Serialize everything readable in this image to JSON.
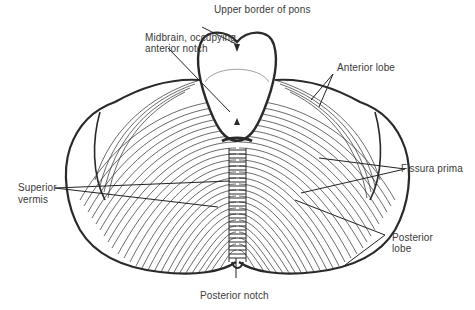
{
  "diagram": {
    "labels": {
      "upper_border_pons": "Upper border of pons",
      "midbrain_line1": "Midbrain, occupying",
      "midbrain_line2": "anterior notch",
      "anterior_lobe": "Anterior lobe",
      "fissura_prima": "Fissura prima",
      "superior_vermis_line1": "Superior",
      "superior_vermis_line2": "vermis",
      "posterior_lobe_line1": "Posterior",
      "posterior_lobe_line2": "lobe",
      "posterior_notch": "Posterior notch"
    },
    "colors": {
      "ink": "#2a2a2a",
      "label": "#3a3a3a",
      "background": "#ffffff"
    }
  }
}
